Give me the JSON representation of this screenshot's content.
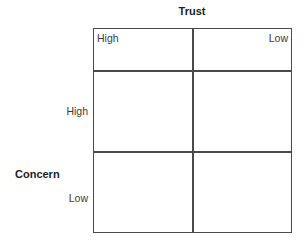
{
  "diagram": {
    "type": "2x2 matrix",
    "x_axis": {
      "title": "Trust",
      "labels": [
        "High",
        "Low"
      ]
    },
    "y_axis": {
      "title": "Concern",
      "labels": [
        "High",
        "Low"
      ]
    },
    "cells": [
      {
        "row": "High",
        "col": "High",
        "text": ""
      },
      {
        "row": "High",
        "col": "Low",
        "text": ""
      },
      {
        "row": "Low",
        "col": "High",
        "text": ""
      },
      {
        "row": "Low",
        "col": "Low",
        "text": ""
      }
    ],
    "colors": {
      "line": "#4a4a4a",
      "text": "#2a2a2a",
      "background": "#ffffff"
    }
  }
}
